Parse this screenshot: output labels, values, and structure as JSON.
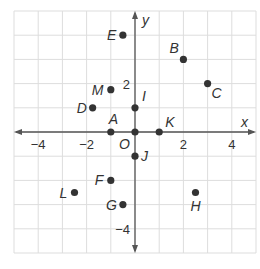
{
  "chart_data": {
    "type": "scatter",
    "title": "",
    "xlabel": "x",
    "ylabel": "y",
    "xlim": [
      -5,
      5
    ],
    "ylim": [
      -5,
      5
    ],
    "grid": true,
    "x_ticks": [
      {
        "value": -4,
        "label": "−4"
      },
      {
        "value": -2,
        "label": "−2"
      },
      {
        "value": 2,
        "label": "2"
      },
      {
        "value": 4,
        "label": "4"
      }
    ],
    "y_ticks": [
      {
        "value": 2,
        "label": "2"
      },
      {
        "value": -4,
        "label": "−4"
      }
    ],
    "origin_label": "O",
    "points": [
      {
        "name": "A",
        "x": -1,
        "y": 0,
        "label_dx": -2,
        "label_dy": -8
      },
      {
        "name": "B",
        "x": 2,
        "y": 3,
        "label_dx": -14,
        "label_dy": -6
      },
      {
        "name": "C",
        "x": 3,
        "y": 2,
        "label_dx": 4,
        "label_dy": 14
      },
      {
        "name": "D",
        "x": -1.75,
        "y": 1,
        "label_dx": -16,
        "label_dy": 5
      },
      {
        "name": "E",
        "x": -0.5,
        "y": 4,
        "label_dx": -16,
        "label_dy": 5
      },
      {
        "name": "F",
        "x": -1,
        "y": -2,
        "label_dx": -16,
        "label_dy": 5
      },
      {
        "name": "G",
        "x": -0.5,
        "y": -3,
        "label_dx": -17,
        "label_dy": 5
      },
      {
        "name": "H",
        "x": 2.5,
        "y": -2.5,
        "label_dx": -5,
        "label_dy": 18
      },
      {
        "name": "I",
        "x": 0,
        "y": 1,
        "label_dx": 7,
        "label_dy": -7
      },
      {
        "name": "J",
        "x": 0,
        "y": -1,
        "label_dx": 6,
        "label_dy": 5
      },
      {
        "name": "K",
        "x": 1,
        "y": 0,
        "label_dx": 6,
        "label_dy": -5
      },
      {
        "name": "L",
        "x": -2.5,
        "y": -2.5,
        "label_dx": -15,
        "label_dy": 5
      },
      {
        "name": "M",
        "x": -1,
        "y": 1.75,
        "label_dx": -19,
        "label_dy": 5
      },
      {
        "name": "O",
        "x": 0,
        "y": 0,
        "label_dx": -16,
        "label_dy": 17,
        "no_label": true
      }
    ]
  },
  "colors": {
    "grid": "#dddddd",
    "axis": "#555555",
    "point": "#333333",
    "text": "#333333"
  }
}
